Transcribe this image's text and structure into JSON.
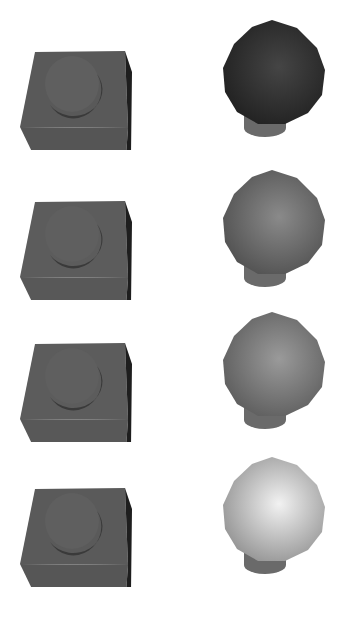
{
  "scene": {
    "description": "Four rows of rendered 3D objects: left a dark block with a circular recessed hole, right a sphere on a short cylinder base; sphere shading gets lighter from top to bottom",
    "rows": [
      {
        "top": 0,
        "block": {
          "color": "#595959",
          "side": "#1e1e1e",
          "front": "#555555"
        },
        "sphere": {
          "light": "#454545",
          "dark": "#1f1f1f",
          "base": "#6a6a6a"
        }
      },
      {
        "top": 150,
        "block": {
          "color": "#5c5c5c",
          "side": "#1e1e1e",
          "front": "#585858"
        },
        "sphere": {
          "light": "#8a8a8a",
          "dark": "#4e4e4e",
          "base": "#6a6a6a"
        }
      },
      {
        "top": 292,
        "block": {
          "color": "#5c5c5c",
          "side": "#1e1e1e",
          "front": "#585858"
        },
        "sphere": {
          "light": "#9a9a9a",
          "dark": "#5a5a5a",
          "base": "#6a6a6a"
        }
      },
      {
        "top": 437,
        "block": {
          "color": "#5a5a5a",
          "side": "#1e1e1e",
          "front": "#565656"
        },
        "sphere": {
          "light": "#f2f2f2",
          "dark": "#8e8e8e",
          "base": "#6a6a6a"
        }
      }
    ]
  }
}
